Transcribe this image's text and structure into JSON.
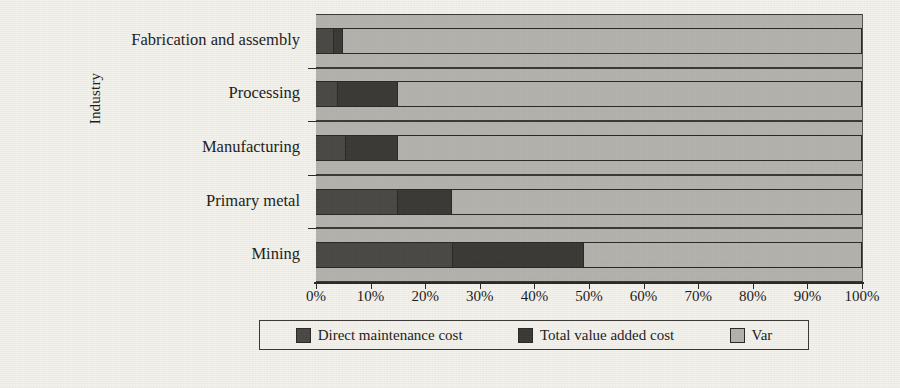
{
  "chart_data": {
    "type": "bar",
    "orientation": "horizontal",
    "stacked": true,
    "normalized_percent": true,
    "title": "",
    "xlabel": "",
    "ylabel": "Industry",
    "xlim": [
      0,
      100
    ],
    "xtick_labels": [
      "0%",
      "10%",
      "20%",
      "30%",
      "40%",
      "50%",
      "60%",
      "70%",
      "80%",
      "90%",
      "100%"
    ],
    "xtick_values": [
      0,
      10,
      20,
      30,
      40,
      50,
      60,
      70,
      80,
      90,
      100
    ],
    "grid": "vertical",
    "legend_position": "bottom",
    "categories": [
      "Fabrication and assembly",
      "Processing",
      "Manufacturing",
      "Primary metal",
      "Mining"
    ],
    "series": [
      {
        "name": "Direct maintenance cost",
        "color": "#4a4844",
        "values": [
          3.3,
          4.0,
          5.5,
          15.0,
          25.0
        ]
      },
      {
        "name": "Total value added cost",
        "color": "#3b3936",
        "values": [
          1.7,
          11.0,
          9.5,
          10.0,
          24.0
        ]
      },
      {
        "name": "Var",
        "color": "#b4b2ad",
        "values": [
          95.0,
          85.0,
          85.0,
          75.0,
          51.0
        ]
      }
    ],
    "legend_entries": [
      {
        "label": "Direct maintenance cost",
        "color": "#4a4844"
      },
      {
        "label": "Total value added cost",
        "color": "#3b3936"
      },
      {
        "label": "Var",
        "color": "#b4b2ad"
      }
    ]
  },
  "colors": {
    "background": "#f2f1ec",
    "axis": "#2a2724",
    "gridline": "#54504b",
    "series_0": "#4a4844",
    "series_1": "#3b3936",
    "series_2": "#b4b2ad"
  }
}
